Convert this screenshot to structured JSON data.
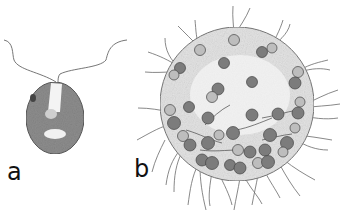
{
  "figure": {
    "panels": [
      {
        "id": "a",
        "label": "a",
        "subject": "single biflagellate green alga cell (Chlamydomonas-like)"
      },
      {
        "id": "b",
        "label": "b",
        "subject": "spherical colony of biflagellate cells (Volvox-like)"
      }
    ]
  },
  "colors": {
    "line": "#555555",
    "cell_fill": "#8a8a8a",
    "cell_dark": "#666666",
    "colony_fill": "#e2e2e2",
    "colony_edge": "#777777",
    "label": "#111111"
  }
}
